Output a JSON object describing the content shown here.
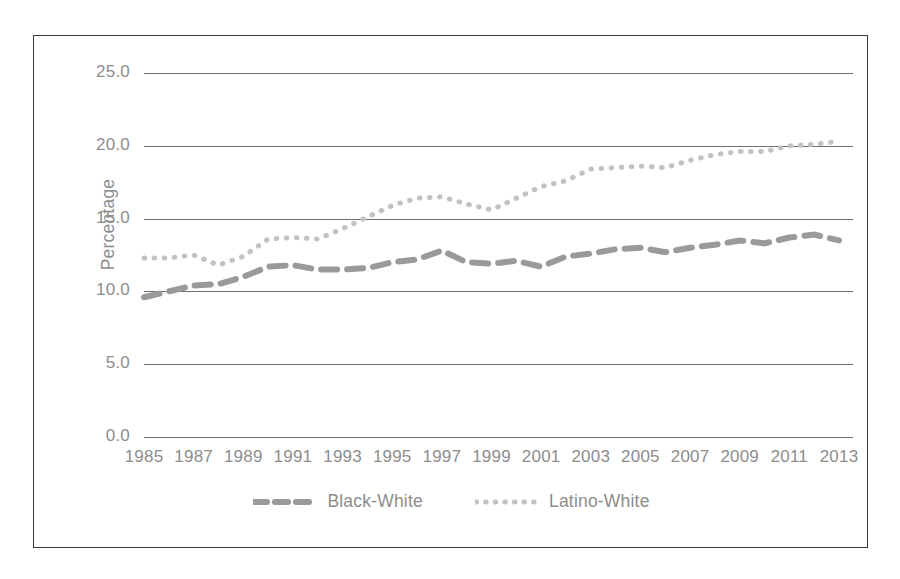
{
  "chart_data": {
    "type": "line",
    "title": "",
    "xlabel": "",
    "ylabel": "Percentage",
    "ylim": [
      0.0,
      25.0
    ],
    "xlim": [
      1985,
      2013
    ],
    "grid": true,
    "legend_position": "bottom",
    "y_ticks": [
      "0.0",
      "5.0",
      "10.0",
      "15.0",
      "20.0",
      "25.0"
    ],
    "y_tick_values": [
      0.0,
      5.0,
      10.0,
      15.0,
      20.0,
      25.0
    ],
    "x_tick_labels": [
      "1985",
      "1987",
      "1989",
      "1991",
      "1993",
      "1995",
      "1997",
      "1999",
      "2001",
      "2003",
      "2005",
      "2007",
      "2009",
      "2011",
      "2013"
    ],
    "x_tick_values": [
      1985,
      1987,
      1989,
      1991,
      1993,
      1995,
      1997,
      1999,
      2001,
      2003,
      2005,
      2007,
      2009,
      2011,
      2013
    ],
    "x": [
      1985,
      1986,
      1987,
      1988,
      1989,
      1990,
      1991,
      1992,
      1993,
      1994,
      1995,
      1996,
      1997,
      1998,
      1999,
      2000,
      2001,
      2002,
      2003,
      2004,
      2005,
      2006,
      2007,
      2008,
      2009,
      2010,
      2011,
      2012,
      2013
    ],
    "series": [
      {
        "name": "Black-White",
        "style": "dashed",
        "color": "#9a9a9a",
        "values": [
          9.6,
          10.0,
          10.4,
          10.5,
          11.0,
          11.7,
          11.8,
          11.5,
          11.5,
          11.6,
          12.0,
          12.2,
          12.8,
          12.0,
          11.9,
          12.1,
          11.7,
          12.4,
          12.6,
          12.9,
          13.0,
          12.7,
          13.0,
          13.2,
          13.5,
          13.3,
          13.7,
          13.9,
          13.5
        ]
      },
      {
        "name": "Latino-White",
        "style": "dotted",
        "color": "#c2c2c2",
        "values": [
          12.3,
          12.3,
          12.5,
          11.8,
          12.4,
          13.6,
          13.7,
          13.6,
          14.3,
          15.1,
          15.9,
          16.4,
          16.5,
          16.0,
          15.6,
          16.4,
          17.2,
          17.6,
          18.4,
          18.5,
          18.6,
          18.5,
          19.0,
          19.4,
          19.6,
          19.6,
          20.0,
          20.1,
          20.3
        ]
      }
    ]
  },
  "legend": {
    "items": [
      {
        "label": "Black-White",
        "swatch": "dashed-line-swatch"
      },
      {
        "label": "Latino-White",
        "swatch": "dotted-line-swatch"
      }
    ]
  },
  "colors": {
    "black_white_series": "#9a9a9a",
    "latino_white_series": "#c2c2c2",
    "gridline": "#6e6e6e",
    "axis_text": "#8d8d8d",
    "frame_border": "#3a3a3a",
    "background": "#ffffff"
  }
}
